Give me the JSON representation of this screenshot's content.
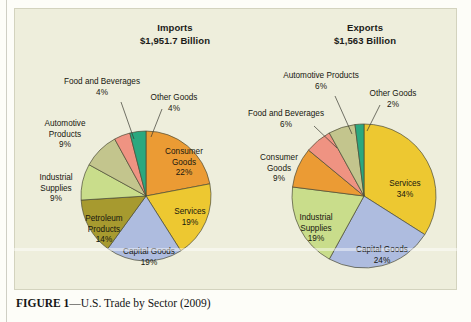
{
  "figure": {
    "caption_prefix": "FIGURE 1",
    "caption_text": "—U.S. Trade by Sector (2009)"
  },
  "colors": {
    "panel_background": "#eeeedc",
    "page_background": "#fdfdf8",
    "slice_outline": "#4a4a35",
    "consumer_goods": "#eb9b34",
    "services": "#edc831",
    "capital_goods": "#aebcdf",
    "petroleum_products": "#a79a2f",
    "industrial_supplies": "#c9dd8b",
    "automotive_products": "#c3c58d",
    "food_and_beverages": "#ef9382",
    "other_goods": "#2aa87f"
  },
  "charts": {
    "imports": {
      "title": "Imports",
      "subtitle": "$1,951.7 Billion"
    },
    "exports": {
      "title": "Exports",
      "subtitle": "$1,563 Billion"
    }
  },
  "chart_data": [
    {
      "type": "pie",
      "title": "Imports",
      "subtitle": "$1,951.7 Billion",
      "total_label": "$1,951.7 Billion",
      "total_value": 1951.7,
      "units": "billions of U.S. dollars",
      "legend": "none",
      "grid": false,
      "categories": [
        "Consumer Goods",
        "Services",
        "Capital Goods",
        "Petroleum Products",
        "Industrial Supplies",
        "Automotive Products",
        "Food and Beverages",
        "Other Goods"
      ],
      "values": [
        22,
        19,
        19,
        14,
        9,
        9,
        4,
        4
      ],
      "slices": [
        {
          "label": "Consumer Goods",
          "value": 22,
          "value_label": "22%",
          "color": "#eb9b34",
          "label_placement": "inside",
          "label_lines": [
            "Consumer",
            "Goods",
            "22%"
          ]
        },
        {
          "label": "Services",
          "value": 19,
          "value_label": "19%",
          "color": "#edc831",
          "label_placement": "inside",
          "label_lines": [
            "Services",
            "19%"
          ]
        },
        {
          "label": "Capital Goods",
          "value": 19,
          "value_label": "19%",
          "color": "#aebcdf",
          "label_placement": "inside",
          "label_lines": [
            "Capital Goods",
            "19%"
          ]
        },
        {
          "label": "Petroleum Products",
          "value": 14,
          "value_label": "14%",
          "color": "#a79a2f",
          "label_placement": "inside",
          "label_lines": [
            "Petroleum",
            "Products",
            "14%"
          ]
        },
        {
          "label": "Industrial Supplies",
          "value": 9,
          "value_label": "9%",
          "color": "#c9dd8b",
          "label_placement": "outside",
          "label_lines": [
            "Industrial",
            "Supplies",
            "9%"
          ]
        },
        {
          "label": "Automotive Products",
          "value": 9,
          "value_label": "9%",
          "color": "#c3c58d",
          "label_placement": "outside",
          "label_lines": [
            "Automotive",
            "Products",
            "9%"
          ]
        },
        {
          "label": "Food and Beverages",
          "value": 4,
          "value_label": "4%",
          "color": "#ef9382",
          "label_placement": "callout",
          "label_lines": [
            "Food and Beverages",
            "4%"
          ]
        },
        {
          "label": "Other Goods",
          "value": 4,
          "value_label": "4%",
          "color": "#2aa87f",
          "label_placement": "callout",
          "label_lines": [
            "Other Goods",
            "4%"
          ]
        }
      ]
    },
    {
      "type": "pie",
      "title": "Exports",
      "subtitle": "$1,563 Billion",
      "total_label": "$1,563 Billion",
      "total_value": 1563,
      "units": "billions of U.S. dollars",
      "legend": "none",
      "grid": false,
      "categories": [
        "Services",
        "Capital Goods",
        "Industrial Supplies",
        "Consumer Goods",
        "Food and Beverages",
        "Automotive Products",
        "Other Goods"
      ],
      "values": [
        34,
        24,
        19,
        9,
        6,
        6,
        2
      ],
      "slices": [
        {
          "label": "Services",
          "value": 34,
          "value_label": "34%",
          "color": "#edc831",
          "label_placement": "inside",
          "label_lines": [
            "Services",
            "34%"
          ]
        },
        {
          "label": "Capital Goods",
          "value": 24,
          "value_label": "24%",
          "color": "#aebcdf",
          "label_placement": "inside",
          "label_lines": [
            "Capital Goods",
            "24%"
          ]
        },
        {
          "label": "Industrial Supplies",
          "value": 19,
          "value_label": "19%",
          "color": "#c9dd8b",
          "label_placement": "inside",
          "label_lines": [
            "Industrial",
            "Supplies",
            "19%"
          ]
        },
        {
          "label": "Consumer Goods",
          "value": 9,
          "value_label": "9%",
          "color": "#eb9b34",
          "label_placement": "outside",
          "label_lines": [
            "Consumer",
            "Goods",
            "9%"
          ]
        },
        {
          "label": "Food and Beverages",
          "value": 6,
          "value_label": "6%",
          "color": "#ef9382",
          "label_placement": "callout",
          "label_lines": [
            "Food and Beverages",
            "6%"
          ]
        },
        {
          "label": "Automotive Products",
          "value": 6,
          "value_label": "6%",
          "color": "#c3c58d",
          "label_placement": "callout",
          "label_lines": [
            "Automotive Products",
            "6%"
          ]
        },
        {
          "label": "Other Goods",
          "value": 2,
          "value_label": "2%",
          "color": "#2aa87f",
          "label_placement": "callout",
          "label_lines": [
            "Other Goods",
            "2%"
          ]
        }
      ]
    }
  ],
  "layout": {
    "imports_pie": {
      "cx": 132,
      "cy": 188,
      "r": 65,
      "start_angle": 0
    },
    "exports_pie": {
      "cx": 350,
      "cy": 188,
      "r": 72,
      "start_angle": 0
    },
    "imports_labels": [
      {
        "name": "consumer-goods",
        "x": 170,
        "y": 146,
        "anchor": "middle",
        "leader": null
      },
      {
        "name": "services",
        "x": 176,
        "y": 206,
        "anchor": "middle",
        "leader": null
      },
      {
        "name": "capital-goods",
        "x": 135,
        "y": 246,
        "anchor": "middle",
        "leader": null
      },
      {
        "name": "petroleum-products",
        "x": 90,
        "y": 213,
        "anchor": "middle",
        "leader": null
      },
      {
        "name": "industrial-supplies",
        "x": 42,
        "y": 172,
        "anchor": "middle",
        "leader": null
      },
      {
        "name": "automotive-products",
        "x": 51,
        "y": 118,
        "anchor": "middle",
        "leader": null
      },
      {
        "name": "food-and-beverages",
        "x": 88,
        "y": 76,
        "anchor": "middle",
        "leader": {
          "x1": 107,
          "y1": 94,
          "x2": 120,
          "y2": 131
        }
      },
      {
        "name": "other-goods",
        "x": 160,
        "y": 92,
        "anchor": "middle",
        "leader": {
          "x1": 148,
          "y1": 101,
          "x2": 137,
          "y2": 129
        }
      }
    ],
    "exports_labels": [
      {
        "name": "services",
        "x": 391,
        "y": 178,
        "anchor": "middle",
        "leader": null
      },
      {
        "name": "capital-goods",
        "x": 368,
        "y": 244,
        "anchor": "middle",
        "leader": null
      },
      {
        "name": "industrial-supplies",
        "x": 302,
        "y": 212,
        "anchor": "middle",
        "leader": null
      },
      {
        "name": "consumer-goods",
        "x": 265,
        "y": 152,
        "anchor": "middle",
        "leader": null
      },
      {
        "name": "food-and-beverages",
        "x": 272,
        "y": 108,
        "anchor": "middle",
        "leader": {
          "x1": 300,
          "y1": 118,
          "x2": 323,
          "y2": 140
        }
      },
      {
        "name": "automotive-products",
        "x": 307,
        "y": 70,
        "anchor": "middle",
        "leader": {
          "x1": 321,
          "y1": 88,
          "x2": 338,
          "y2": 126
        }
      },
      {
        "name": "other-goods",
        "x": 379,
        "y": 88,
        "anchor": "middle",
        "leader": {
          "x1": 366,
          "y1": 97,
          "x2": 353,
          "y2": 123
        }
      }
    ]
  }
}
